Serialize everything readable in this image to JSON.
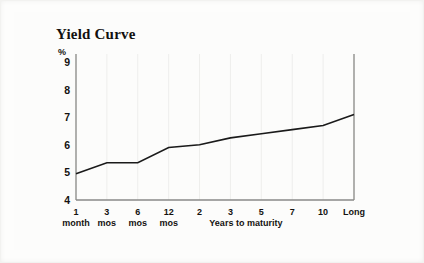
{
  "figure": {
    "title": "Yield Curve",
    "background_color": "#fcfcfb",
    "line_color": "#1a1a1a",
    "axis_color": "#8a8a88",
    "grid_color": "#eeeeec"
  },
  "chart_data": {
    "type": "line",
    "title": "Yield Curve",
    "xlabel": "Years to maturity",
    "ylabel": "%",
    "categories": [
      "1 month",
      "3 mos",
      "6 mos",
      "12 mos",
      "2",
      "3",
      "5",
      "7",
      "10",
      "Long"
    ],
    "tick_labels": [
      {
        "line1": "1",
        "line2": "month"
      },
      {
        "line1": "3",
        "line2": "mos"
      },
      {
        "line1": "6",
        "line2": "mos"
      },
      {
        "line1": "12",
        "line2": "mos"
      },
      {
        "line1": "2",
        "line2": ""
      },
      {
        "line1": "3",
        "line2": ""
      },
      {
        "line1": "5",
        "line2": ""
      },
      {
        "line1": "7",
        "line2": ""
      },
      {
        "line1": "10",
        "line2": ""
      },
      {
        "line1": "Long",
        "line2": ""
      }
    ],
    "values": [
      4.95,
      5.35,
      5.35,
      5.9,
      6.0,
      6.25,
      6.4,
      6.55,
      6.7,
      7.1
    ],
    "ylim": [
      4,
      9
    ],
    "yticks": [
      9,
      8,
      7,
      6,
      5,
      4
    ],
    "ytick_labels": [
      "9",
      "8",
      "7",
      "6",
      "5",
      "4"
    ],
    "grid": "vertical-only",
    "legend": "none"
  }
}
